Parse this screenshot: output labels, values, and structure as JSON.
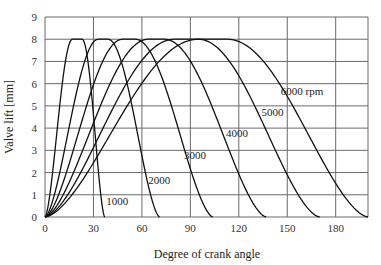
{
  "chart_data": {
    "type": "line",
    "title": "",
    "xlabel": "Degree of crank angle",
    "ylabel": "Valve lift [mm]",
    "xlim": [
      0,
      200
    ],
    "ylim": [
      0,
      9
    ],
    "x_ticks": [
      0,
      30,
      60,
      90,
      120,
      150,
      180
    ],
    "y_ticks": [
      0,
      1,
      2,
      3,
      4,
      5,
      6,
      7,
      8,
      9
    ],
    "grid": true,
    "legend": "inline labels on curves",
    "max_lift": 8,
    "series": [
      {
        "name": "1000",
        "label": "1000",
        "open": 0,
        "peak_start": 17,
        "peak_end": 23,
        "close": 37,
        "label_pos": [
          38,
          0.55
        ]
      },
      {
        "name": "2000",
        "label": "2000",
        "open": 0,
        "peak_start": 33,
        "peak_end": 39,
        "close": 71,
        "label_pos": [
          64,
          1.5
        ]
      },
      {
        "name": "3000",
        "label": "3000",
        "open": 0,
        "peak_start": 48,
        "peak_end": 56,
        "close": 104,
        "label_pos": [
          86,
          2.6
        ]
      },
      {
        "name": "4000",
        "label": "4000",
        "open": 0,
        "peak_start": 64,
        "peak_end": 74,
        "close": 137,
        "label_pos": [
          112,
          3.6
        ]
      },
      {
        "name": "5000",
        "label": "5000",
        "open": 0,
        "peak_start": 80,
        "peak_end": 95,
        "close": 170,
        "label_pos": [
          134,
          4.55
        ]
      },
      {
        "name": "6000 rpm",
        "label": "6000 rpm",
        "open": 0,
        "peak_start": 95,
        "peak_end": 113,
        "close": 200,
        "label_pos": [
          146,
          5.5
        ]
      }
    ]
  },
  "plot_area": {
    "x0": 45,
    "y0": 217,
    "x1": 368,
    "y1": 17
  }
}
